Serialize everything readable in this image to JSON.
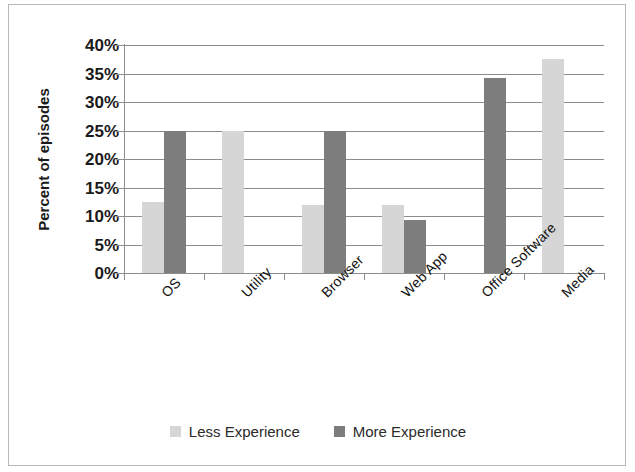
{
  "chart_data": {
    "type": "bar",
    "title": "",
    "xlabel": "",
    "ylabel": "Percent of episodes",
    "ylim": [
      0,
      40
    ],
    "ytick_step": 5,
    "ytick_labels": [
      "40%",
      "35%",
      "30%",
      "25%",
      "20%",
      "15%",
      "10%",
      "5%",
      "0%"
    ],
    "ytick_values": [
      40,
      35,
      30,
      25,
      20,
      15,
      10,
      5,
      0
    ],
    "grid": true,
    "legend_position": "bottom",
    "categories": [
      "OS",
      "Utility",
      "Browser",
      "Web App",
      "Office Software",
      "Media"
    ],
    "series": [
      {
        "name": "Less Experience",
        "color": "#d6d6d6",
        "values": [
          12.5,
          25.0,
          12.0,
          12.0,
          0,
          37.5
        ]
      },
      {
        "name": "More Experience",
        "color": "#7d7d7d",
        "values": [
          25.0,
          0,
          25.0,
          9.3,
          34.3,
          0
        ]
      }
    ]
  },
  "axis": {
    "y_title": "Percent of episodes"
  },
  "legend": {
    "entries": [
      {
        "label": "Less Experience"
      },
      {
        "label": "More Experience"
      }
    ]
  }
}
